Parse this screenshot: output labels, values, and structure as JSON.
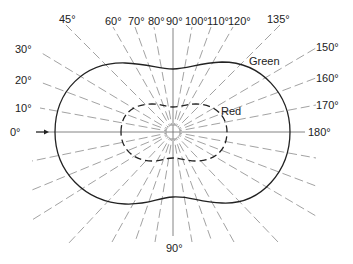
{
  "diagram": {
    "center": {
      "x": 173,
      "y": 132
    },
    "angle_labels": {
      "a0": "0°",
      "a10": "10°",
      "a20": "20°",
      "a30": "30°",
      "a45": "45°",
      "a60": "60°",
      "a70": "70°",
      "a80": "80°",
      "a90_top": "90°",
      "a100": "100°",
      "a110": "110°",
      "a120": "120°",
      "a135": "135°",
      "a150": "150°",
      "a160": "160°",
      "a170": "170°",
      "a180": "180°",
      "a90_bottom": "90°"
    },
    "curves": [
      {
        "name": "Green",
        "label": "Green",
        "style": "solid",
        "color": "#222222"
      },
      {
        "name": "Red",
        "label": "Red",
        "style": "dashed",
        "color": "#222222"
      }
    ],
    "arrow": {
      "at": "0°",
      "direction": "right"
    }
  }
}
